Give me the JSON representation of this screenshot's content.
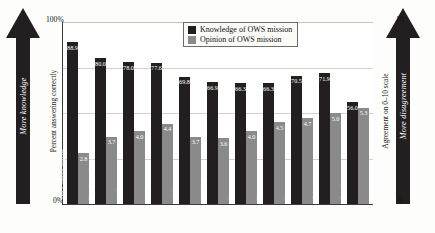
{
  "legend": {
    "items": [
      {
        "label": "Knowledge of OWS mission",
        "color": "#231f20",
        "key": "knowledge"
      },
      {
        "label": "Opinion of OWS mission",
        "color": "#8a8a8a",
        "key": "opinion"
      }
    ]
  },
  "left_axis": {
    "caption": "Percent answering correctly",
    "max_label": "100%",
    "min_label": "0%",
    "arrow_label": "More knowledge"
  },
  "right_axis": {
    "caption": "Agreement on 0–10 scale",
    "max_label": "10",
    "min_label": "0",
    "arrow_label": "More disagreement"
  },
  "chart_data": {
    "type": "bar",
    "title": "",
    "xlabel": "",
    "ylabel": "Percent answering correctly",
    "y2label": "Agreement on 0–10 scale",
    "ylim": [
      0,
      100
    ],
    "y2lim": [
      0,
      10
    ],
    "grid": true,
    "legend_position": "top-center",
    "categories": [
      "The Colbert Report",
      "The Daily Show",
      "NPR",
      "Online news",
      "CNN",
      "MSNBC",
      "Network news",
      "Total sample",
      "Newspapers",
      "Talk radio",
      "Fox News"
    ],
    "series": [
      {
        "name": "Knowledge of OWS mission",
        "axis": "left",
        "color": "#231f20",
        "values": [
          88.9,
          80.0,
          78.0,
          77.6,
          69.8,
          66.9,
          66.3,
          66.3,
          70.5,
          71.9,
          56.0
        ]
      },
      {
        "name": "Opinion of OWS mission",
        "axis": "right",
        "color": "#8a8a8a",
        "values": [
          2.8,
          3.7,
          4.0,
          4.4,
          3.7,
          3.6,
          4.0,
          4.5,
          4.7,
          5.0,
          5.3
        ]
      }
    ]
  }
}
